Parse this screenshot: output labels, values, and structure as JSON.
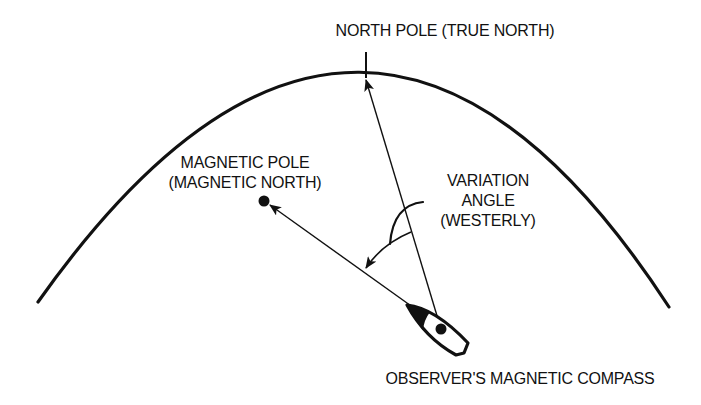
{
  "diagram": {
    "labels": {
      "true_north": "NORTH POLE (TRUE NORTH)",
      "magnetic_pole_line1": "MAGNETIC POLE",
      "magnetic_pole_line2": "(MAGNETIC NORTH)",
      "variation_line1": "VARIATION",
      "variation_line2": "ANGLE",
      "variation_line3": "(WESTERLY)",
      "observer": "OBSERVER'S MAGNETIC COMPASS"
    },
    "colors": {
      "ink": "#111111",
      "background": "#ffffff"
    },
    "nodes": [
      {
        "id": "true-north",
        "label": "NORTH POLE (TRUE NORTH)"
      },
      {
        "id": "magnetic-pole",
        "label": "MAGNETIC POLE (MAGNETIC NORTH)"
      },
      {
        "id": "observer",
        "label": "OBSERVER'S MAGNETIC COMPASS"
      }
    ],
    "edges": [
      {
        "from": "observer",
        "to": "true-north",
        "type": "arrow"
      },
      {
        "from": "observer",
        "to": "magnetic-pole",
        "type": "arrow"
      },
      {
        "from": "true-north-line",
        "to": "magnetic-line",
        "type": "angle-arrow",
        "label": "VARIATION ANGLE (WESTERLY)"
      }
    ]
  }
}
